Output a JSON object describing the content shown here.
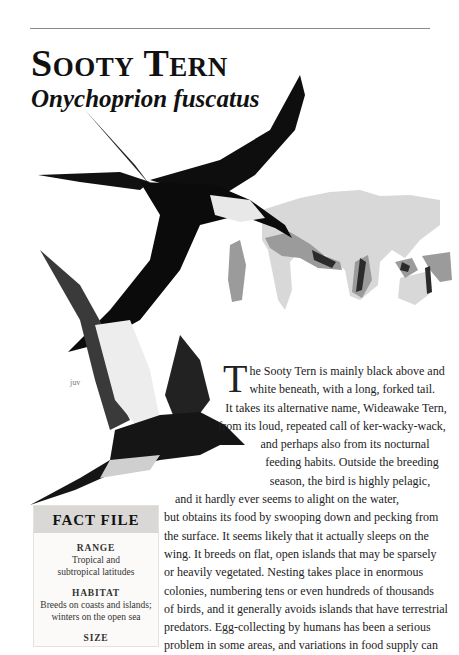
{
  "header": {
    "title": "Sooty Tern",
    "scientific_name": "Onychoprion fuscatus"
  },
  "illustration": {
    "juvenile_label": "juv",
    "map_colors": {
      "land": "#d6d6d6",
      "range": "#9a9a9a",
      "breeding": "#2a2a2a"
    }
  },
  "article": {
    "dropcap": "T",
    "lines": [
      "he Sooty Tern is mainly black above and",
      "white beneath, with a long, forked tail.",
      "It takes its alternative name, Wideawake Tern,",
      "from its loud, repeated call of ker-wacky-wack,",
      "and perhaps also from its nocturnal",
      "feeding habits. Outside the breeding",
      "season, the bird is highly pelagic,",
      "and it hardly ever seems to alight on the water,",
      "but obtains its food by swooping down and pecking from",
      "the surface. It seems likely that it actually sleeps on the",
      "wing. It breeds on flat, open islands that may be sparsely",
      "or heavily vegetated. Nesting takes place in enormous",
      "colonies, numbering tens or even hundreds of thousands",
      "of birds, and it generally avoids islands that have terrestrial",
      "predators. Egg-collecting by humans has been a serious",
      "problem in some areas, and variations in food supply can"
    ]
  },
  "fact_file": {
    "heading": "Fact File",
    "items": [
      {
        "label": "Range",
        "value_lines": [
          "Tropical and",
          "subtropical latitudes"
        ]
      },
      {
        "label": "Habitat",
        "value_lines": [
          "Breeds on coasts and islands;",
          "winters on the open sea"
        ]
      },
      {
        "label": "Size",
        "value_lines": [
          ""
        ]
      }
    ]
  }
}
